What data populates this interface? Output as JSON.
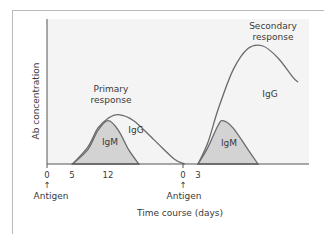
{
  "chart_data": {
    "type": "area",
    "title": "",
    "xlabel": "Time course (days)",
    "ylabel": "Ab concentration",
    "grid": false,
    "legend": "none",
    "x_ticks": [
      {
        "label": "0",
        "day": 0,
        "phase": "primary"
      },
      {
        "label": "5",
        "day": 5,
        "phase": "primary"
      },
      {
        "label": "12",
        "day": 12,
        "phase": "primary"
      },
      {
        "label": "0",
        "day": 0,
        "phase": "secondary"
      },
      {
        "label": "3",
        "day": 3,
        "phase": "secondary"
      }
    ],
    "annotations": [
      {
        "text": "Antigen",
        "at": "primary day 0",
        "arrow": "up"
      },
      {
        "text": "Antigen",
        "at": "secondary day 0",
        "arrow": "up"
      },
      {
        "text": "Primary response",
        "at": "primary peak"
      },
      {
        "text": "Secondary response",
        "at": "secondary peak"
      }
    ],
    "series": [
      {
        "name": "IgM",
        "phase": "primary",
        "shaded": true,
        "points": [
          [
            5,
            0
          ],
          [
            8,
            0.12
          ],
          [
            10,
            0.28
          ],
          [
            12,
            0.36
          ],
          [
            14,
            0.28
          ],
          [
            16,
            0.12
          ],
          [
            18,
            0
          ]
        ]
      },
      {
        "name": "IgG",
        "phase": "primary",
        "shaded": false,
        "points": [
          [
            5,
            0
          ],
          [
            8,
            0.14
          ],
          [
            10,
            0.3
          ],
          [
            12,
            0.38
          ],
          [
            14,
            0.41
          ],
          [
            17,
            0.36
          ],
          [
            21,
            0.2
          ],
          [
            25,
            0.04
          ],
          [
            27,
            0
          ]
        ]
      },
      {
        "name": "IgM",
        "phase": "secondary",
        "shaded": true,
        "points": [
          [
            3,
            0
          ],
          [
            5,
            0.14
          ],
          [
            7,
            0.32
          ],
          [
            8,
            0.36
          ],
          [
            10,
            0.3
          ],
          [
            13,
            0.12
          ],
          [
            15,
            0
          ]
        ]
      },
      {
        "name": "IgG",
        "phase": "secondary",
        "shaded": false,
        "points": [
          [
            3,
            0
          ],
          [
            5,
            0.18
          ],
          [
            7,
            0.45
          ],
          [
            10,
            0.78
          ],
          [
            13,
            0.96
          ],
          [
            16,
            0.98
          ],
          [
            19,
            0.88
          ],
          [
            22,
            0.72
          ],
          [
            23,
            0.68
          ]
        ]
      }
    ],
    "ylim": [
      0,
      1
    ]
  },
  "labels": {
    "ylabel": "Ab concentration",
    "xlabel": "Time course (days)",
    "primary_response_1": "Primary",
    "primary_response_2": "response",
    "secondary_response_1": "Secondary",
    "secondary_response_2": "response",
    "igm_primary": "IgM",
    "igg_primary": "IgG",
    "igm_secondary": "IgM",
    "igg_secondary": "IgG",
    "tick_0a": "0",
    "tick_5": "5",
    "tick_12": "12",
    "tick_0b": "0",
    "tick_3": "3",
    "antigen_1": "Antigen",
    "antigen_2": "Antigen",
    "arrow": "↑"
  },
  "colors": {
    "plot_bg": "#f4f4f4",
    "igm_fill": "#d3d3d3",
    "curve": "#6b6b6b",
    "axis": "#555555",
    "text": "#3a3a3a"
  }
}
